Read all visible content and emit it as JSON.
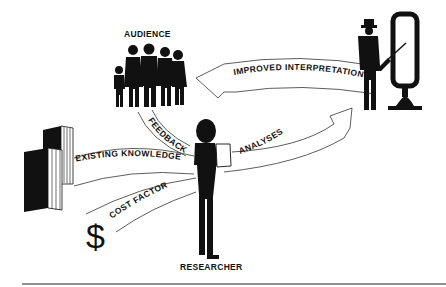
{
  "diagram": {
    "nodes": {
      "audience": "AUDIENCE",
      "researcher": "RESEARCHER"
    },
    "flows": {
      "improved_interpretation": "IMPROVED INTERPRETATION",
      "feedback": "FEEDBACK",
      "existing_knowledge": "EXISTING KNOWLEDGE",
      "analyses": "ANALYSES",
      "cost_factor": "COST FACTOR"
    },
    "symbols": {
      "currency": "$"
    },
    "colors": {
      "ink": "#111111",
      "background": "#ffffff"
    }
  }
}
